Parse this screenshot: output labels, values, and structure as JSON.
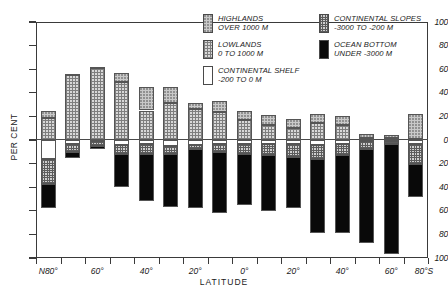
{
  "chart_data": {
    "type": "bar",
    "title": "",
    "subtitle": "",
    "xlabel": "LATITUDE",
    "ylabel": "PER CENT",
    "orientation": "vertical-stacked-diverging",
    "grid": false,
    "legend_position": "top-right",
    "ylim": [
      -100,
      100
    ],
    "y_ticks": [
      100,
      80,
      60,
      40,
      20,
      0,
      20,
      40,
      60,
      80,
      100
    ],
    "y_tick_labels": [
      "100",
      "80",
      "60",
      "40",
      "20",
      "0",
      "20",
      "40",
      "60",
      "80",
      "100"
    ],
    "x_tick_labels": [
      "N80°",
      "60°",
      "40°",
      "20°",
      "0°",
      "20°",
      "40°",
      "60°",
      "80°S"
    ],
    "note_above_zero": "land area above sea level",
    "note_below_zero": "sea floor area below sea level",
    "categories": [
      "N80°",
      "N75°",
      "N70°",
      "N65°",
      "N60°",
      "N50°",
      "N40°",
      "N30°",
      "N20°",
      "N10°",
      "0°",
      "S10°",
      "S20°",
      "S40°",
      "S60°",
      "S80°"
    ],
    "series": [
      {
        "name": "HIGHLANDS OVER 1000 M",
        "key": "highlands",
        "fill": "light-stipple",
        "color": "#c9c9c9",
        "values": [
          25,
          56,
          62,
          57,
          45,
          45,
          31,
          33,
          25,
          21,
          18,
          22,
          20,
          5,
          4,
          22
        ]
      },
      {
        "name": "LOWLANDS 0 TO 1000 M",
        "key": "lowlands",
        "fill": "medium-checker",
        "color": "#d8d8d8",
        "values": [
          19,
          55,
          61,
          49,
          25,
          31,
          26,
          24,
          17,
          13,
          10,
          14,
          13,
          2,
          2,
          1
        ]
      },
      {
        "name": "CONTINENTAL SHELF -200 TO 0 M",
        "key": "shelf",
        "fill": "white",
        "color": "#ffffff",
        "values": [
          -16,
          -3,
          -1,
          -4,
          -3,
          -5,
          -4,
          -3,
          -3,
          -3,
          -3,
          -4,
          -3,
          -1,
          -1,
          -3
        ]
      },
      {
        "name": "CONTINENTAL SLOPES -3000 TO -200 M",
        "key": "slopes",
        "fill": "dense-checker",
        "color": "#cfcfcf",
        "values": [
          -37,
          -10,
          -5,
          -12,
          -12,
          -12,
          -8,
          -10,
          -12,
          -13,
          -14,
          -16,
          -13,
          -8,
          -3,
          -20
        ]
      },
      {
        "name": "OCEAN BOTTOM UNDER -3000 M",
        "key": "ocean_bottom",
        "fill": "solid-black",
        "color": "#090909",
        "values": [
          -58,
          -15,
          -8,
          -40,
          -52,
          -57,
          -58,
          -62,
          -55,
          -60,
          -58,
          -79,
          -79,
          -87,
          -97,
          -48
        ]
      }
    ],
    "bars": [
      {
        "label": "N80°",
        "highlands": 25,
        "lowlands": 19,
        "shelf": -16,
        "slopes": -37,
        "ocean_bottom": -58
      },
      {
        "label": "N75°",
        "highlands": 56,
        "lowlands": 55,
        "shelf": -3,
        "slopes": -10,
        "ocean_bottom": -15
      },
      {
        "label": "N70°",
        "highlands": 62,
        "lowlands": 61,
        "shelf": -1,
        "slopes": -5,
        "ocean_bottom": -8
      },
      {
        "label": "N65°",
        "highlands": 57,
        "lowlands": 49,
        "shelf": -4,
        "slopes": -12,
        "ocean_bottom": -40
      },
      {
        "label": "N60°",
        "highlands": 45,
        "lowlands": 25,
        "shelf": -3,
        "slopes": -12,
        "ocean_bottom": -52
      },
      {
        "label": "N50°",
        "highlands": 45,
        "lowlands": 31,
        "shelf": -5,
        "slopes": -12,
        "ocean_bottom": -57
      },
      {
        "label": "N40°",
        "highlands": 31,
        "lowlands": 26,
        "shelf": -4,
        "slopes": -8,
        "ocean_bottom": -58
      },
      {
        "label": "N30°",
        "highlands": 33,
        "lowlands": 24,
        "shelf": -3,
        "slopes": -10,
        "ocean_bottom": -62
      },
      {
        "label": "N20°",
        "highlands": 25,
        "lowlands": 17,
        "shelf": -3,
        "slopes": -12,
        "ocean_bottom": -55
      },
      {
        "label": "N10°",
        "highlands": 21,
        "lowlands": 13,
        "shelf": -3,
        "slopes": -13,
        "ocean_bottom": -60
      },
      {
        "label": "0°",
        "highlands": 18,
        "lowlands": 10,
        "shelf": -3,
        "slopes": -14,
        "ocean_bottom": -58
      },
      {
        "label": "S10°",
        "highlands": 22,
        "lowlands": 14,
        "shelf": -4,
        "slopes": -16,
        "ocean_bottom": -79
      },
      {
        "label": "S20°",
        "highlands": 20,
        "lowlands": 13,
        "shelf": -3,
        "slopes": -13,
        "ocean_bottom": -79
      },
      {
        "label": "S40°",
        "highlands": 5,
        "lowlands": 2,
        "shelf": -1,
        "slopes": -8,
        "ocean_bottom": -87
      },
      {
        "label": "S60°",
        "highlands": 4,
        "lowlands": 2,
        "shelf": -1,
        "slopes": -3,
        "ocean_bottom": -97
      },
      {
        "label": "S80°",
        "highlands": 22,
        "lowlands": 1,
        "shelf": -3,
        "slopes": -20,
        "ocean_bottom": -48
      }
    ]
  },
  "legend": {
    "items": [
      {
        "name": "HIGHLANDS",
        "range": "OVER 1000 M",
        "swatch": "highlands-swatch"
      },
      {
        "name": "LOWLANDS",
        "range": "0 TO 1000 M",
        "swatch": "lowlands-swatch"
      },
      {
        "name": "CONTINENTAL SHELF",
        "range": "-200 TO 0 M",
        "swatch": "shelf-swatch"
      },
      {
        "name": "CONTINENTAL SLOPES",
        "range": "-3000 TO -200 M",
        "swatch": "slopes-swatch"
      },
      {
        "name": "OCEAN BOTTOM",
        "range": "UNDER -3000 M",
        "swatch": "ocean-bottom-swatch"
      }
    ]
  },
  "axes": {
    "y_caption": "PER CENT",
    "x_caption": "LATITUDE",
    "y_labels": [
      "100",
      "80",
      "60",
      "40",
      "20",
      "0",
      "20",
      "40",
      "60",
      "80",
      "100"
    ],
    "x_labels": [
      "N80°",
      "60°",
      "40°",
      "20°",
      "0°",
      "20°",
      "40°",
      "60°",
      "80°S"
    ]
  }
}
